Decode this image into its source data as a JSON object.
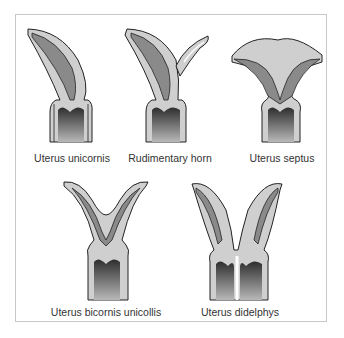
{
  "figure": {
    "panels": [
      {
        "id": "unicornis",
        "label": "Uterus unicornis"
      },
      {
        "id": "rudimentary-horn",
        "label": "Rudimentary horn"
      },
      {
        "id": "septus",
        "label": "Uterus septus"
      },
      {
        "id": "bicornis-unicollis",
        "label": "Uterus bicornis unicollis"
      },
      {
        "id": "didelphys",
        "label": "Uterus didelphys"
      }
    ],
    "colors": {
      "wall": "#cfcfcf",
      "cavity": "#8a8a8a",
      "cervix_dark": "#3a3a3a",
      "cervix_light": "#b0b0b0",
      "outline": "#222222",
      "frame": "#c8c8c8"
    }
  }
}
